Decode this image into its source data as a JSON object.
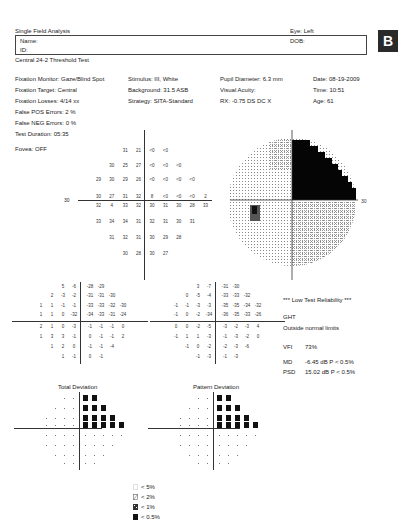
{
  "header": {
    "title": "Single Field Analysis",
    "eye": "Eye: Left",
    "name_label": "Name:",
    "id_label": "ID:",
    "dob_label": "DOB:",
    "test_name": "Central 24-2 Threshold Test",
    "panel_letter": "B"
  },
  "params": {
    "col1": [
      "Fixation Monitor: Gaze/Blind Spot",
      "Fixation Target: Central",
      "Fixation Losses: 4/14 xx",
      "False POS Errors:  2 %",
      "False NEG Errors:  0 %",
      "Test Duration: 05:35"
    ],
    "col2": [
      "Stimulus: III, White",
      "Background: 31.5 ASB",
      "Strategy: SITA-Standard"
    ],
    "col3": [
      "Pupil Diameter: 6.3 mm",
      "Visual Acuity:",
      "RX: -0.75 DS     DC  X"
    ],
    "col4": [
      "Date: 08-19-2009",
      "Time: 10:51",
      "Age: 61"
    ],
    "fovea": "Fovea: OFF"
  },
  "threshold": {
    "axis_label_left": "30",
    "axis_label_right": "30",
    "rows": [
      [
        "",
        "",
        "",
        "31",
        "21",
        "<0",
        "<0",
        "",
        "",
        ""
      ],
      [
        "",
        "",
        "30",
        "25",
        "27",
        "<0",
        "<0",
        "<0",
        "",
        ""
      ],
      [
        "",
        "29",
        "30",
        "29",
        "26",
        "<0",
        "<0",
        "<0",
        "<0",
        ""
      ],
      [
        "",
        "30",
        "27",
        "31",
        "32",
        "8",
        "<0",
        "<0",
        "<0",
        "2"
      ],
      [
        "",
        "32",
        "4",
        "33",
        "32",
        "30",
        "31",
        "30",
        "28",
        "33"
      ],
      [
        "",
        "33",
        "34",
        "34",
        "31",
        "32",
        "31",
        "30",
        "31",
        ""
      ],
      [
        "",
        "",
        "31",
        "32",
        "31",
        "30",
        "29",
        "28",
        "",
        ""
      ],
      [
        "",
        "",
        "",
        "30",
        "28",
        "30",
        "27",
        "",
        "",
        ""
      ]
    ]
  },
  "total_deviation_values": {
    "rows": [
      [
        "",
        "",
        "5",
        "-6",
        "-28",
        "-29",
        "",
        ""
      ],
      [
        "",
        "2",
        "-3",
        "-2",
        "-31",
        "-31",
        "-30",
        ""
      ],
      [
        "1",
        "1",
        "-1",
        "-1",
        "-33",
        "-33",
        "-32",
        "-30"
      ],
      [
        "1",
        "",
        "1",
        "0",
        "-32",
        "-34",
        "-33",
        "-31",
        "-24"
      ],
      [
        "2",
        "",
        "1",
        "0",
        "-3",
        "-1",
        "-1",
        "-1",
        "0"
      ],
      [
        "1",
        "3",
        "3",
        "-1",
        "0",
        "-1",
        "-1",
        "2"
      ],
      [
        "",
        "1",
        "2",
        "0",
        "-1",
        "-1",
        "-4",
        ""
      ],
      [
        "",
        "",
        "1",
        "-1",
        "0",
        "-1",
        "",
        ""
      ]
    ]
  },
  "pattern_deviation_values": {
    "rows": [
      [
        "",
        "",
        "3",
        "-7",
        "-31",
        "-30",
        "",
        ""
      ],
      [
        "",
        "0",
        "-5",
        "-4",
        "-33",
        "-33",
        "-32",
        ""
      ],
      [
        "-1",
        "-1",
        "-3",
        "-3",
        "-35",
        "-35",
        "-34",
        "-32"
      ],
      [
        "-1",
        "",
        "0",
        "-2",
        "-34",
        "-36",
        "-35",
        "-33",
        "-26"
      ],
      [
        "0",
        "",
        "0",
        "-2",
        "-5",
        "-3",
        "-2",
        "-3",
        "4"
      ],
      [
        "-1",
        "1",
        "1",
        "-3",
        "-1",
        "-3",
        "-2",
        "0"
      ],
      [
        "",
        "-1",
        "0",
        "-2",
        "-2",
        "-3",
        "-6",
        ""
      ],
      [
        "",
        "",
        "-1",
        "-3",
        "-1",
        "-3",
        "",
        ""
      ]
    ]
  },
  "summary": {
    "reliability": "*** Low Test Reliability ***",
    "ght_label": "GHT",
    "ght_value": "Outside normal limits",
    "vfi_label": "VFI",
    "vfi_value": "73%",
    "md_label": "MD",
    "md_value": "-6.45 dB  P < 0.5%",
    "psd_label": "PSD",
    "psd_value": "15.02 dB  P < 0.5%"
  },
  "plots": {
    "total_deviation_title": "Total Deviation",
    "pattern_deviation_title": "Pattern Deviation"
  },
  "legend": {
    "items": [
      {
        "symbol": "p5",
        "label": "< 5%"
      },
      {
        "symbol": "p2",
        "label": "< 2%"
      },
      {
        "symbol": "p1",
        "label": "< 1%"
      },
      {
        "symbol": "p05",
        "label": "< 0.5%"
      }
    ]
  }
}
